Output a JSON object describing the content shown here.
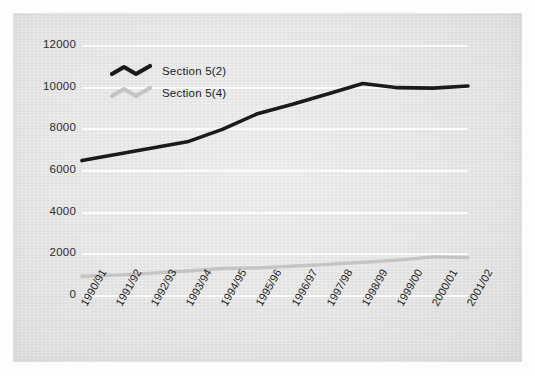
{
  "chart_data": {
    "type": "line",
    "title": "",
    "xlabel": "",
    "ylabel": "",
    "ylim": [
      0,
      12000
    ],
    "ytick_values": [
      0,
      2000,
      4000,
      6000,
      8000,
      10000,
      12000
    ],
    "ytick_labels": [
      "0",
      "2000",
      "4000",
      "6000",
      "8000",
      "10000",
      "12000"
    ],
    "grid": true,
    "legend_position": "upper-left-inside",
    "categories": [
      "1990/91",
      "1991/92",
      "1992/93",
      "1993/94",
      "1994/95",
      "1995/96",
      "1996/97",
      "1997/98",
      "1998/99",
      "1999/00",
      "2000/01",
      "2001/02"
    ],
    "series": [
      {
        "name": "Section 5(2)",
        "color": "#1a1a1a",
        "values": [
          6500,
          6800,
          7100,
          7400,
          8000,
          8750,
          9200,
          9700,
          10200,
          10000,
          9980,
          10080
        ]
      },
      {
        "name": "Section 5(4)",
        "color": "#c4c4c4",
        "values": [
          950,
          1000,
          1100,
          1200,
          1320,
          1350,
          1430,
          1520,
          1620,
          1720,
          1880,
          1840
        ]
      }
    ]
  },
  "legend": {
    "items": [
      {
        "label": "Section 5(2)",
        "color": "#1a1a1a"
      },
      {
        "label": "Section 5(4)",
        "color": "#c4c4c4"
      }
    ]
  },
  "figure": {
    "background_color": "#ffffff",
    "panel_color": "#e6e6e6",
    "gridline_color": "#fcfcfc"
  }
}
